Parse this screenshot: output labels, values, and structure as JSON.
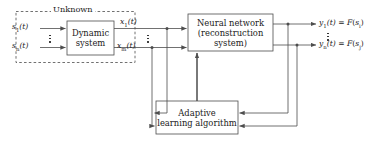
{
  "diagram": {
    "unknown_label": "Unknown",
    "colors": {
      "line": "#4d4d4d",
      "text": "#1a1a1a",
      "background": "#ffffff",
      "dashed_border": "#4d4d4d"
    },
    "blocks": {
      "dynamic_system": {
        "line1": "Dynamic",
        "line2": "system"
      },
      "neural_network": {
        "line1": "Neural network",
        "line2": "(reconstruction system)"
      },
      "adaptive_learning": {
        "line1": "Adaptive",
        "line2": "learning algorithm"
      }
    },
    "inputs": [
      {
        "name": "s",
        "sub": "1",
        "arg": "(t)"
      },
      {
        "name": "s",
        "sub": "n",
        "arg": "(t)"
      }
    ],
    "internal_signals": [
      {
        "name": "x",
        "sub": "1",
        "arg": "(t)"
      },
      {
        "name": "x",
        "sub": "m",
        "arg": "(t)"
      }
    ],
    "outputs": [
      {
        "name": "y",
        "sub": "1",
        "arg": "(t)",
        "eq": "=",
        "fn": "F",
        "fnarg_name": "s",
        "fnarg_sub": "i"
      },
      {
        "name": "y",
        "sub": "n",
        "arg": "(t)",
        "eq": "=",
        "fn": "F",
        "fnarg_name": "s",
        "fnarg_sub": "j"
      }
    ],
    "ellipsis_marker": "vertical-dots"
  }
}
